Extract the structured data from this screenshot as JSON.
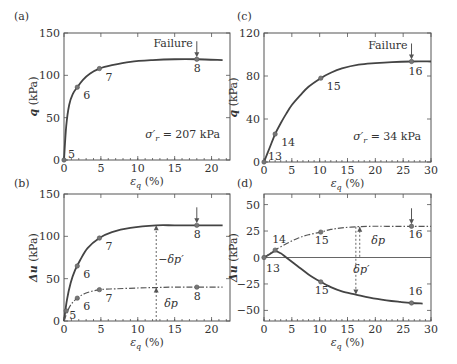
{
  "chart_data": [
    {
      "id": "a",
      "type": "line",
      "panel_label": "(a)",
      "xlabel": "ε_q (%)",
      "ylabel": "q (kPa)",
      "xlim": [
        0,
        22.5
      ],
      "ylim": [
        0,
        150
      ],
      "xticks": [
        0,
        5,
        10,
        15,
        20
      ],
      "yticks": [
        0,
        50,
        100,
        150
      ],
      "annotation": "σ′r = 207 kPa",
      "failure_label": "Failure",
      "failure_x": 18,
      "series": [
        {
          "name": "q",
          "style": "solid",
          "x": [
            0,
            0.3,
            0.7,
            1.2,
            1.8,
            2.6,
            3.5,
            4.8,
            6.5,
            9,
            12,
            15,
            18,
            21.5
          ],
          "y": [
            0,
            40,
            65,
            78,
            86,
            95,
            102,
            108,
            112,
            116,
            118,
            119,
            119,
            118
          ]
        }
      ],
      "points": [
        {
          "label": "5",
          "x": 0,
          "y": 0,
          "series": 0
        },
        {
          "label": "6",
          "x": 1.8,
          "y": 86,
          "series": 0
        },
        {
          "label": "7",
          "x": 4.8,
          "y": 108,
          "series": 0
        },
        {
          "label": "8",
          "x": 18,
          "y": 119,
          "series": 0
        }
      ]
    },
    {
      "id": "b",
      "type": "line",
      "panel_label": "(b)",
      "xlabel": "ε_q (%)",
      "ylabel": "Δu (kPa)",
      "xlim": [
        0,
        22.5
      ],
      "ylim": [
        0,
        150
      ],
      "xticks": [
        0,
        5,
        10,
        15,
        20
      ],
      "yticks": [
        0,
        50,
        100,
        150
      ],
      "annotations": [
        {
          "text": "−δp′",
          "x": 14.5,
          "y": 68
        },
        {
          "text": "δp",
          "x": 14.5,
          "y": 17
        }
      ],
      "vline_x": 12.5,
      "failure_x": 18,
      "series": [
        {
          "name": "Δu total",
          "style": "solid",
          "x": [
            0,
            0.4,
            0.9,
            1.5,
            2.2,
            3.2,
            4.8,
            6.5,
            9,
            12.5,
            15,
            18,
            21.5
          ],
          "y": [
            0,
            25,
            45,
            60,
            72,
            86,
            98,
            105,
            110,
            113,
            113,
            113,
            113
          ]
        },
        {
          "name": "δp",
          "style": "dashdot",
          "x": [
            0,
            0.5,
            1,
            1.8,
            3,
            4.8,
            7,
            10,
            12.5,
            15,
            18,
            21.5
          ],
          "y": [
            0,
            12,
            20,
            27,
            33,
            37,
            38,
            39,
            39.5,
            40,
            40,
            40
          ]
        }
      ],
      "points": [
        {
          "label": "5",
          "x": 0.3,
          "y": 12,
          "series": 0
        },
        {
          "label": "6",
          "x": 1.8,
          "y": 65,
          "series": 0
        },
        {
          "label": "7",
          "x": 4.8,
          "y": 98,
          "series": 0
        },
        {
          "label": "8",
          "x": 18,
          "y": 113,
          "series": 0
        },
        {
          "label": "6",
          "x": 1.8,
          "y": 27,
          "series": 1
        },
        {
          "label": "7",
          "x": 4.8,
          "y": 37,
          "series": 1
        },
        {
          "label": "8",
          "x": 18,
          "y": 40,
          "series": 1
        }
      ]
    },
    {
      "id": "c",
      "type": "line",
      "panel_label": "(c)",
      "xlabel": "ε_q (%)",
      "ylabel": "q (kPa)",
      "xlim": [
        0,
        30
      ],
      "ylim": [
        0,
        120
      ],
      "xticks": [
        0,
        5,
        10,
        15,
        20,
        25,
        30
      ],
      "yticks": [
        0,
        40,
        80,
        120
      ],
      "annotation": "σ′r = 34 kPa",
      "failure_label": "Failure",
      "failure_x": 26.5,
      "series": [
        {
          "name": "q",
          "style": "solid",
          "x": [
            0,
            1,
            2,
            3,
            4,
            5,
            6.5,
            8,
            10.2,
            12,
            14,
            17,
            20,
            23,
            26.5,
            30
          ],
          "y": [
            0,
            13,
            26,
            36,
            45,
            53,
            62,
            70,
            78,
            83,
            87,
            90.5,
            92,
            93,
            93.5,
            93.5
          ]
        }
      ],
      "points": [
        {
          "label": "13",
          "x": 0,
          "y": 0,
          "series": 0
        },
        {
          "label": "14",
          "x": 2,
          "y": 26,
          "series": 0
        },
        {
          "label": "15",
          "x": 10.2,
          "y": 78,
          "series": 0
        },
        {
          "label": "16",
          "x": 26.5,
          "y": 93.5,
          "series": 0
        }
      ]
    },
    {
      "id": "d",
      "type": "line",
      "panel_label": "(d)",
      "xlabel": "ε_q (%)",
      "ylabel": "Δu (kPa)",
      "xlim": [
        0,
        30
      ],
      "ylim": [
        -60,
        60
      ],
      "xticks": [
        0,
        5,
        10,
        15,
        20,
        25,
        30
      ],
      "yticks": [
        -50,
        -25,
        0,
        25,
        50
      ],
      "annotations": [
        {
          "text": "δp",
          "x": 20.5,
          "y": 13
        },
        {
          "text": "δp′",
          "x": 17.5,
          "y": -15
        }
      ],
      "vline_x": 16.5,
      "vline2_x": 17.2,
      "failure_x": 26.5,
      "series": [
        {
          "name": "Δu total",
          "style": "solid",
          "x": [
            0,
            1,
            2,
            3,
            4,
            6,
            8,
            10.2,
            12,
            14,
            16.5,
            19,
            22,
            24.5,
            26.5,
            28.5
          ],
          "y": [
            0,
            3,
            6,
            4,
            0,
            -8,
            -16,
            -23,
            -28,
            -32,
            -35,
            -38,
            -40.5,
            -42,
            -43,
            -43.5
          ]
        },
        {
          "name": "δp",
          "style": "dashdot",
          "x": [
            0,
            1,
            2,
            4,
            6,
            8,
            10.2,
            12,
            14,
            16.5,
            19,
            22,
            26.5,
            30
          ],
          "y": [
            0,
            3.5,
            7,
            13,
            18,
            21.5,
            24,
            26.5,
            28,
            29,
            29.5,
            29.5,
            29.5,
            29.5
          ]
        }
      ],
      "points": [
        {
          "label": "13",
          "x": 0,
          "y": 0,
          "series": 0
        },
        {
          "label": "14",
          "x": 2,
          "y": 7,
          "series": 1
        },
        {
          "label": "15",
          "x": 10.2,
          "y": 24,
          "series": 1
        },
        {
          "label": "16",
          "x": 26.5,
          "y": 29.5,
          "series": 1
        },
        {
          "label": "15",
          "x": 10.2,
          "y": -23,
          "series": 0
        },
        {
          "label": "16",
          "x": 26.5,
          "y": -43,
          "series": 0
        }
      ]
    }
  ]
}
